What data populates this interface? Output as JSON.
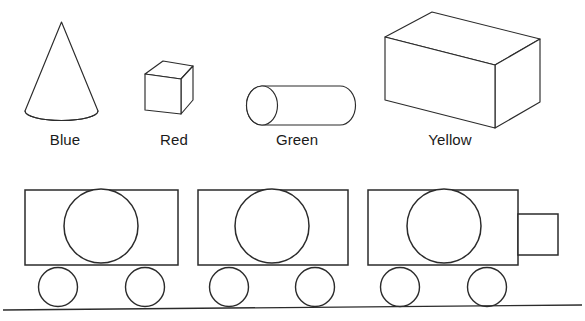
{
  "diagram": {
    "background_color": "#ffffff",
    "stroke_color": "#2b2b2b",
    "width": 585,
    "height": 321
  },
  "shapes_row": {
    "items": [
      {
        "id": "cone",
        "icon_name": "cone-shape",
        "label": "Blue",
        "label_left": 38,
        "label_top": 131,
        "label_width": 54
      },
      {
        "id": "cube",
        "icon_name": "cube-shape",
        "label": "Red",
        "label_left": 150,
        "label_top": 131,
        "label_width": 48
      },
      {
        "id": "cylinder",
        "icon_name": "cylinder-shape",
        "label": "Green",
        "label_left": 266,
        "label_top": 131,
        "label_width": 62
      },
      {
        "id": "box",
        "icon_name": "rectangular-prism-shape",
        "label": "Yellow",
        "label_left": 418,
        "label_top": 131,
        "label_width": 64
      }
    ]
  },
  "train": {
    "car_count": 3,
    "wheels_per_car": 2,
    "has_coupler": true,
    "has_ground_line": true,
    "cars": [
      {
        "id": "car-1",
        "icon_name": "train-car-with-circle"
      },
      {
        "id": "car-2",
        "icon_name": "train-car-with-circle"
      },
      {
        "id": "car-3",
        "icon_name": "train-car-with-circle-and-coupler"
      }
    ]
  }
}
